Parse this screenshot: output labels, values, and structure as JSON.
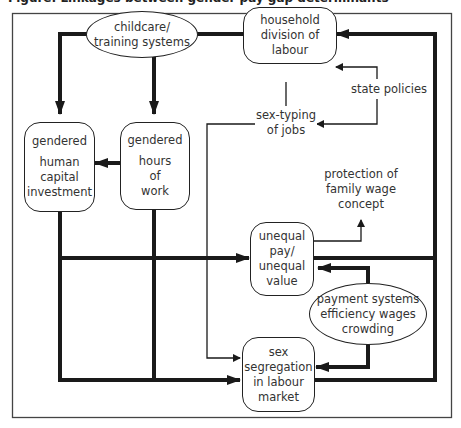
{
  "title": "Figure: Linkages between gender pay gap determinants",
  "nodes": {
    "childcare": "childcare/\ntraining systems",
    "childcare_l1": "childcare/",
    "childcare_l2": "training systems",
    "household_l1": "household",
    "household_l2": "division of",
    "household_l3": "labour",
    "state_policies": "state policies",
    "sextyping_l1": "sex-typing",
    "sextyping_l2": "of jobs",
    "hci_l1": "gendered",
    "hci_l2": "human",
    "hci_l3": "capital",
    "hci_l4": "investment",
    "how_l1": "gendered",
    "how_l2": "hours",
    "how_l3": "of",
    "how_l4": "work",
    "protection_l1": "protection of",
    "protection_l2": "family wage",
    "protection_l3": "concept",
    "unequal_l1": "unequal",
    "unequal_l2": "pay/",
    "unequal_l3": "unequal",
    "unequal_l4": "value",
    "payment_l1": "payment systems",
    "payment_l2": "efficiency wages",
    "payment_l3": "crowding",
    "segregation_l1": "sex",
    "segregation_l2": "segregation",
    "segregation_l3": "in labour",
    "segregation_l4": "market"
  },
  "colors": {
    "line": "#1a1a1a",
    "frame": "#444444",
    "background": "#ffffff"
  }
}
